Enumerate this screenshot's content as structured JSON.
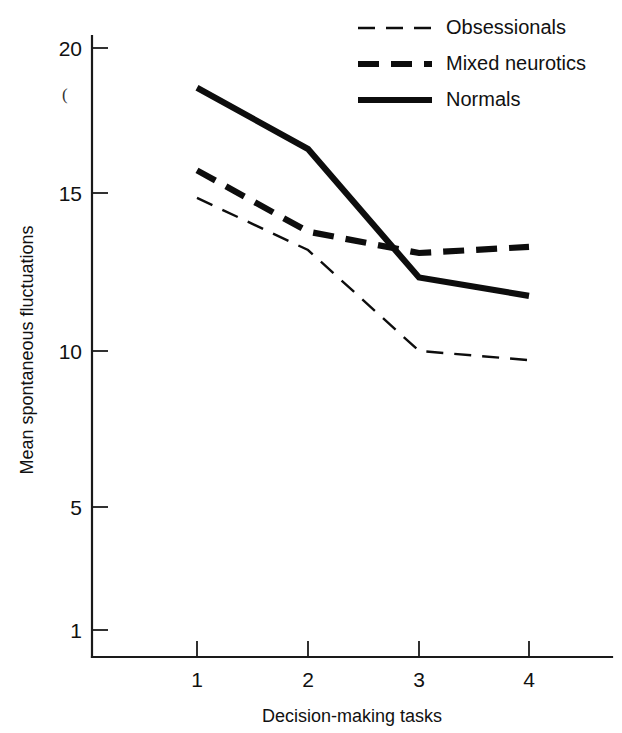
{
  "chart_data": {
    "type": "line",
    "title": "",
    "xlabel": "Decision-making tasks",
    "ylabel": "Mean spontaneous fluctuations",
    "x": [
      1,
      2,
      3,
      4
    ],
    "xticklabels": [
      "1",
      "2",
      "3",
      "4"
    ],
    "yticks": [
      1,
      5,
      10,
      15,
      20
    ],
    "yticklabels": [
      "1",
      "5",
      "10",
      "15",
      "20"
    ],
    "xlim": [
      0.55,
      4.45
    ],
    "ylim": [
      0.1,
      20.9
    ],
    "grid": false,
    "legend_position": "top-right",
    "series": [
      {
        "name": "Obsessionals",
        "style": "thin-dashed",
        "color": "#0d0d0d",
        "values": [
          15.1,
          13.4,
          10.1,
          9.8
        ]
      },
      {
        "name": "Mixed neurotics",
        "style": "thick-dashed",
        "color": "#0d0d0d",
        "values": [
          16.0,
          14.0,
          13.3,
          13.5
        ]
      },
      {
        "name": "Normals",
        "style": "thick-solid",
        "color": "#0d0d0d",
        "values": [
          18.7,
          16.7,
          12.5,
          11.9
        ]
      }
    ]
  },
  "axes": {
    "y_title": "Mean spontaneous fluctuations",
    "x_title": "Decision-making tasks",
    "y_tick_0": "1",
    "y_tick_1": "5",
    "y_tick_2": "10",
    "y_tick_3": "15",
    "y_tick_4": "20",
    "x_tick_0": "1",
    "x_tick_1": "2",
    "x_tick_2": "3",
    "x_tick_3": "4"
  },
  "legend": {
    "entry_0": "Obsessionals",
    "entry_1": "Mixed neurotics",
    "entry_2": "Normals"
  },
  "artifacts": {
    "stray_mark": "("
  }
}
